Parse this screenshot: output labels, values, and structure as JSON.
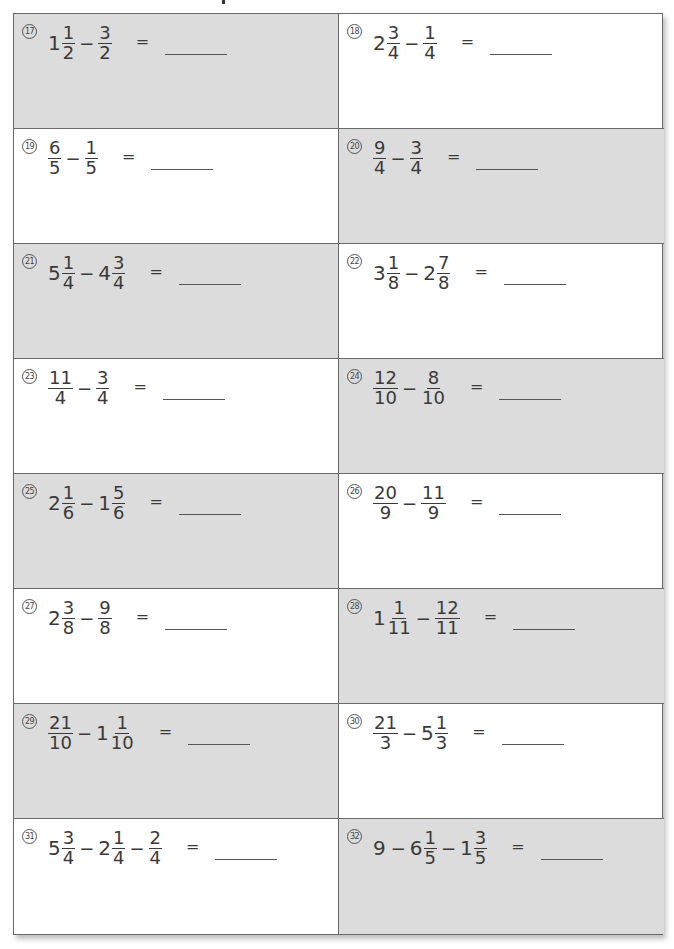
{
  "problems": [
    {
      "num": "17",
      "terms": [
        {
          "w": "1",
          "n": "1",
          "d": "2"
        },
        {
          "n": "3",
          "d": "2"
        }
      ],
      "shaded": true
    },
    {
      "num": "18",
      "terms": [
        {
          "w": "2",
          "n": "3",
          "d": "4"
        },
        {
          "n": "1",
          "d": "4"
        }
      ],
      "shaded": false
    },
    {
      "num": "19",
      "terms": [
        {
          "n": "6",
          "d": "5"
        },
        {
          "n": "1",
          "d": "5"
        }
      ],
      "shaded": false
    },
    {
      "num": "20",
      "terms": [
        {
          "n": "9",
          "d": "4"
        },
        {
          "n": "3",
          "d": "4"
        }
      ],
      "shaded": true
    },
    {
      "num": "21",
      "terms": [
        {
          "w": "5",
          "n": "1",
          "d": "4"
        },
        {
          "w": "4",
          "n": "3",
          "d": "4"
        }
      ],
      "shaded": true
    },
    {
      "num": "22",
      "terms": [
        {
          "w": "3",
          "n": "1",
          "d": "8"
        },
        {
          "w": "2",
          "n": "7",
          "d": "8"
        }
      ],
      "shaded": false
    },
    {
      "num": "23",
      "terms": [
        {
          "n": "11",
          "d": "4"
        },
        {
          "n": "3",
          "d": "4"
        }
      ],
      "shaded": false
    },
    {
      "num": "24",
      "terms": [
        {
          "n": "12",
          "d": "10"
        },
        {
          "n": "8",
          "d": "10"
        }
      ],
      "shaded": true
    },
    {
      "num": "25",
      "terms": [
        {
          "w": "2",
          "n": "1",
          "d": "6"
        },
        {
          "w": "1",
          "n": "5",
          "d": "6"
        }
      ],
      "shaded": true
    },
    {
      "num": "26",
      "terms": [
        {
          "n": "20",
          "d": "9"
        },
        {
          "n": "11",
          "d": "9"
        }
      ],
      "shaded": false
    },
    {
      "num": "27",
      "terms": [
        {
          "w": "2",
          "n": "3",
          "d": "8"
        },
        {
          "n": "9",
          "d": "8"
        }
      ],
      "shaded": false
    },
    {
      "num": "28",
      "terms": [
        {
          "w": "1",
          "n": "1",
          "d": "11"
        },
        {
          "n": "12",
          "d": "11"
        }
      ],
      "shaded": true
    },
    {
      "num": "29",
      "terms": [
        {
          "n": "21",
          "d": "10"
        },
        {
          "w": "1",
          "n": "1",
          "d": "10"
        }
      ],
      "shaded": true
    },
    {
      "num": "30",
      "terms": [
        {
          "n": "21",
          "d": "3"
        },
        {
          "w": "5",
          "n": "1",
          "d": "3"
        }
      ],
      "shaded": false
    },
    {
      "num": "31",
      "terms": [
        {
          "w": "5",
          "n": "3",
          "d": "4"
        },
        {
          "w": "2",
          "n": "1",
          "d": "4"
        },
        {
          "n": "2",
          "d": "4"
        }
      ],
      "shaded": false
    },
    {
      "num": "32",
      "terms": [
        {
          "w": "9"
        },
        {
          "w": "6",
          "n": "1",
          "d": "5"
        },
        {
          "w": "1",
          "n": "3",
          "d": "5"
        }
      ],
      "shaded": true
    }
  ],
  "operator": "−",
  "equals": "="
}
